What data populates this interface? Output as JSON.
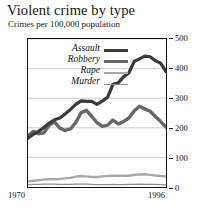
{
  "chart_data": {
    "type": "line",
    "title": "Violent crime by type",
    "subtitle": "Crimes per 100,000 population",
    "xlabel": "",
    "ylabel": "",
    "xlim": [
      1970,
      1996
    ],
    "ylim": [
      0,
      500
    ],
    "yticks": [
      0,
      100,
      200,
      300,
      400,
      500
    ],
    "xticks": [
      1970,
      1996
    ],
    "grid": true,
    "legend_position": "upper-left-inside",
    "x": [
      1970,
      1971,
      1972,
      1973,
      1974,
      1975,
      1976,
      1977,
      1978,
      1979,
      1980,
      1981,
      1982,
      1983,
      1984,
      1985,
      1986,
      1987,
      1988,
      1989,
      1990,
      1991,
      1992,
      1993,
      1994,
      1995,
      1996
    ],
    "series": [
      {
        "name": "Assault",
        "color": "#3a3a3a",
        "width": 3.2,
        "values": [
          165,
          178,
          188,
          201,
          216,
          227,
          233,
          247,
          262,
          279,
          291,
          289,
          289,
          279,
          290,
          303,
          347,
          352,
          372,
          385,
          424,
          433,
          442,
          440,
          427,
          418,
          390
        ]
      },
      {
        "name": "Robbery",
        "color": "#676767",
        "width": 3.4,
        "values": [
          172,
          188,
          180,
          183,
          209,
          220,
          199,
          191,
          196,
          218,
          251,
          259,
          239,
          217,
          205,
          209,
          226,
          213,
          221,
          233,
          257,
          273,
          264,
          256,
          238,
          221,
          202
        ]
      },
      {
        "name": "Rape",
        "color": "#a9a9a9",
        "width": 2.4,
        "values": [
          19,
          21,
          23,
          25,
          26,
          26,
          27,
          29,
          31,
          35,
          37,
          36,
          34,
          34,
          36,
          37,
          38,
          38,
          38,
          38,
          41,
          42,
          43,
          41,
          39,
          37,
          36
        ]
      },
      {
        "name": "Murder",
        "color": "#8e8e8e",
        "width": 1.3,
        "values": [
          8,
          9,
          9,
          10,
          10,
          10,
          9,
          9,
          9,
          10,
          10,
          10,
          9,
          8,
          8,
          8,
          9,
          8,
          8,
          9,
          9,
          10,
          9,
          9,
          9,
          8,
          7
        ]
      }
    ]
  },
  "legend": {
    "items": [
      {
        "label": "Assault"
      },
      {
        "label": "Robbery"
      },
      {
        "label": "Rape"
      },
      {
        "label": "Murder"
      }
    ]
  },
  "axes": {
    "y_labels": [
      "500",
      "400",
      "300",
      "200",
      "100",
      "0"
    ],
    "x_start_label": "1970",
    "x_end_label": "1996"
  }
}
